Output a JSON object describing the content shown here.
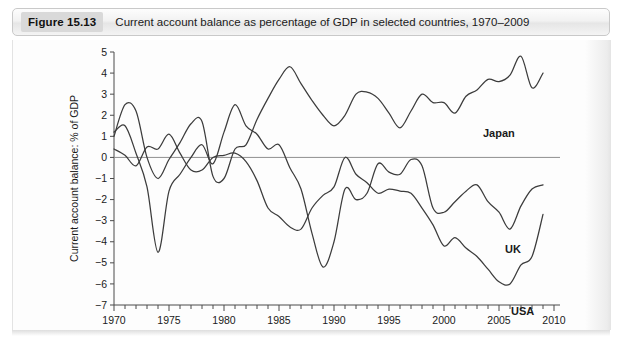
{
  "caption": {
    "figure_tag": "Figure 15.13",
    "title": "Current account balance as percentage of GDP in selected countries, 1970–2009"
  },
  "chart_data": {
    "type": "line",
    "title": "Current account balance as percentage of GDP in selected countries, 1970–2009",
    "xlabel": "",
    "ylabel": "Current account balance: % of GDP",
    "xlim": [
      1970,
      2010
    ],
    "ylim": [
      -7,
      5
    ],
    "ytick_labels": [
      "5",
      "4",
      "3",
      "2",
      "1",
      "0",
      "-1",
      "-2",
      "-3",
      "-4",
      "-5",
      "-6",
      "-7"
    ],
    "ytick_values": [
      5,
      4,
      3,
      2,
      1,
      0,
      -1,
      -2,
      -3,
      -4,
      -5,
      -6,
      -7
    ],
    "xtick_labels": [
      "1970",
      "1975",
      "1980",
      "1985",
      "1990",
      "1995",
      "2000",
      "2005",
      "2010"
    ],
    "xtick_values": [
      1970,
      1975,
      1980,
      1985,
      1990,
      1995,
      2000,
      2005,
      2010
    ],
    "minor_xticks_every": 1,
    "grid": false,
    "zero_line": true,
    "legend_position": "inline-right-labels",
    "x": [
      1970,
      1971,
      1972,
      1973,
      1974,
      1975,
      1976,
      1977,
      1978,
      1979,
      1980,
      1981,
      1982,
      1983,
      1984,
      1985,
      1986,
      1987,
      1988,
      1989,
      1990,
      1991,
      1992,
      1993,
      1994,
      1995,
      1996,
      1997,
      1998,
      1999,
      2000,
      2001,
      2002,
      2003,
      2004,
      2005,
      2006,
      2007,
      2008,
      2009
    ],
    "series": [
      {
        "name": "Japan",
        "label": "Japan",
        "color": "#3c3c3c",
        "values": [
          1.0,
          2.5,
          2.2,
          0.0,
          -1.0,
          -0.1,
          0.7,
          1.6,
          1.7,
          -0.9,
          -1.0,
          0.4,
          0.6,
          1.8,
          2.8,
          3.7,
          4.3,
          3.5,
          2.7,
          2.0,
          1.5,
          2.0,
          3.0,
          3.1,
          2.8,
          2.1,
          1.4,
          2.2,
          3.0,
          2.6,
          2.6,
          2.1,
          2.9,
          3.2,
          3.7,
          3.6,
          3.9,
          4.8,
          3.3,
          4.0
        ]
      },
      {
        "name": "UK",
        "label": "UK",
        "color": "#3c3c3c",
        "values": [
          1.2,
          1.5,
          0.2,
          -1.4,
          -4.5,
          -1.6,
          -0.8,
          0.0,
          0.6,
          -0.3,
          1.2,
          2.5,
          1.5,
          1.1,
          0.4,
          0.6,
          -0.5,
          -1.5,
          -3.6,
          -5.2,
          -4.0,
          -1.5,
          -2.0,
          -1.7,
          -0.3,
          -0.7,
          -0.8,
          -0.1,
          -0.4,
          -2.4,
          -2.6,
          -2.1,
          -1.6,
          -1.3,
          -2.1,
          -2.6,
          -3.4,
          -2.3,
          -1.5,
          -1.3
        ]
      },
      {
        "name": "USA",
        "label": "USA",
        "color": "#3c3c3c",
        "values": [
          0.4,
          0.1,
          -0.4,
          0.5,
          0.4,
          1.1,
          0.2,
          -0.6,
          -0.6,
          0.0,
          0.1,
          0.2,
          -0.2,
          -1.1,
          -2.4,
          -2.8,
          -3.3,
          -3.4,
          -2.4,
          -1.8,
          -1.4,
          0.0,
          -0.8,
          -1.2,
          -1.7,
          -1.5,
          -1.6,
          -1.7,
          -2.4,
          -3.2,
          -4.2,
          -3.8,
          -4.3,
          -4.7,
          -5.3,
          -5.9,
          -6.0,
          -5.1,
          -4.7,
          -2.7
        ]
      }
    ]
  },
  "plot": {
    "geometry": {
      "x_pixel_1970": 101,
      "x_pixel_2010": 541,
      "y_pixel_5": 12,
      "y_pixel_neg7": 265
    }
  }
}
